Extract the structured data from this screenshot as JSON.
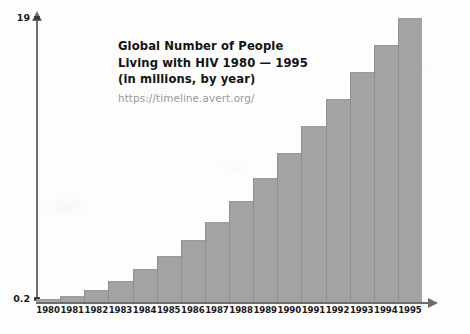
{
  "chart_data": {
    "type": "bar",
    "title": "Global Number of People Living with HIV 1980 — 1995",
    "title_lines": [
      "Global Number of People",
      "Living with HIV 1980 — 1995",
      "(in millions, by year)"
    ],
    "source_url": "https://timeline.avert.org/",
    "subtitle": "(in millions, by year)",
    "xlabel": "Year",
    "ylabel": "",
    "categories": [
      "1980",
      "1981",
      "1982",
      "1983",
      "1984",
      "1985",
      "1986",
      "1987",
      "1988",
      "1989",
      "1990",
      "1991",
      "1992",
      "1993",
      "1994",
      "1995"
    ],
    "values": [
      0.2,
      0.4,
      0.8,
      1.4,
      2.2,
      3.1,
      4.2,
      5.4,
      6.8,
      8.3,
      10.0,
      11.8,
      13.6,
      15.4,
      17.2,
      19.0
    ],
    "ylim": [
      0,
      19
    ],
    "ytick_values": [
      0.2,
      19
    ],
    "ytick_labels": [
      "0.2",
      "19"
    ],
    "grid": false,
    "legend": false,
    "bar_color": "#a3a3a3",
    "axis_color": "#6d6d6d",
    "text_color": "#141414",
    "url_color": "#9a9a9a",
    "background_color": "#fdfdfd"
  },
  "axis": {
    "x_axis_label": "Year",
    "y_top_label": "19",
    "y_bottom_label": "0.2"
  }
}
